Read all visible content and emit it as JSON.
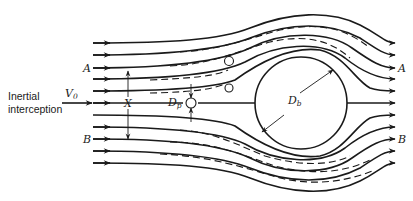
{
  "diagram": {
    "caption_label": {
      "line1": "Inertial",
      "line2": "interception"
    },
    "labels": {
      "velocity": "V",
      "velocity_sub": "0",
      "particle_diameter": "D",
      "particle_diameter_sub": "p",
      "body_diameter": "D",
      "body_diameter_sub": "b",
      "capture_width": "X",
      "streamline_A_left": "A",
      "streamline_A_right": "A",
      "streamline_B_left": "B",
      "streamline_B_right": "B"
    },
    "elements": {
      "streamlines_count": 11,
      "particles_count": 3,
      "collector": "cylinder",
      "trajectory_style": "dashed",
      "streamline_style": "solid with arrows"
    },
    "colors": {
      "ink": "#1a1a1a",
      "background": "#ffffff"
    }
  }
}
